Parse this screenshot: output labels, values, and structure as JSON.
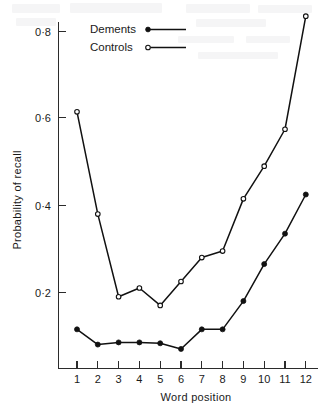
{
  "figure": {
    "background_color": "#ffffff",
    "ink_color": "#111111"
  },
  "legend": {
    "position": "top-left-inside",
    "entries": [
      {
        "label": "Dements",
        "marker": "filled-circle"
      },
      {
        "label": "Controls",
        "marker": "open-circle"
      }
    ]
  },
  "axes": {
    "y_title": "Probability of recall",
    "x_title": "Word position",
    "y_ticks": [
      "0·2",
      "0·4",
      "0·6",
      "0·8"
    ],
    "y_tick_values": [
      0.2,
      0.4,
      0.6,
      0.8
    ],
    "x_ticks": [
      "1",
      "2",
      "3",
      "4",
      "5",
      "6",
      "7",
      "8",
      "9",
      "10",
      "11",
      "12"
    ]
  },
  "chart_data": {
    "type": "line",
    "title": "",
    "subtitle": "",
    "xlabel": "Word position",
    "ylabel": "Probability of recall",
    "x": [
      1,
      2,
      3,
      4,
      5,
      6,
      7,
      8,
      9,
      10,
      11,
      12
    ],
    "categories": [
      "1",
      "2",
      "3",
      "4",
      "5",
      "6",
      "7",
      "8",
      "9",
      "10",
      "11",
      "12"
    ],
    "series": [
      {
        "name": "Controls",
        "marker": "open-circle",
        "values": [
          0.59,
          0.355,
          0.165,
          0.185,
          0.145,
          0.2,
          0.255,
          0.27,
          0.39,
          0.465,
          0.55,
          0.81
        ]
      },
      {
        "name": "Dements",
        "marker": "filled-circle",
        "values": [
          0.09,
          0.055,
          0.06,
          0.06,
          0.058,
          0.045,
          0.09,
          0.09,
          0.155,
          0.24,
          0.31,
          0.4
        ]
      }
    ],
    "xlim": [
      1,
      12
    ],
    "ylim": [
      0,
      0.86
    ],
    "grid": false,
    "legend_position": "top-left"
  }
}
